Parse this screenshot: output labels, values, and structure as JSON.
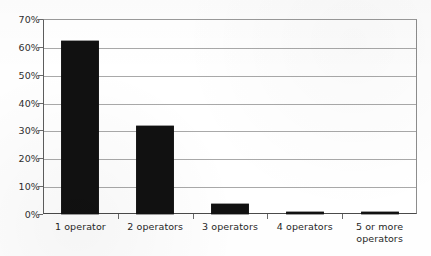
{
  "chart_data": {
    "type": "bar",
    "title": "",
    "subtitle": "",
    "xlabel": "",
    "ylabel": "",
    "categories": [
      "1 operator",
      "2 operators",
      "3 operators",
      "4 operators",
      "5 or more operators"
    ],
    "category_lines": [
      [
        "1 operator"
      ],
      [
        "2 operators"
      ],
      [
        "3 operators"
      ],
      [
        "4 operators"
      ],
      [
        "5 or more",
        "operators"
      ]
    ],
    "values": [
      62,
      31.7,
      3.5,
      0.8,
      0.3
    ],
    "value_labels": [
      "62%",
      "31.7%",
      "3.5%",
      "0.8%",
      "0.3%"
    ],
    "ylim": [
      0,
      70
    ],
    "ytick_values": [
      0,
      10,
      20,
      30,
      40,
      50,
      60,
      70
    ],
    "ytick_labels": [
      "0%",
      "10%",
      "20%",
      "30%",
      "40%",
      "50%",
      "60%",
      "70%"
    ],
    "grid": true,
    "legend": false,
    "legend_position": "none",
    "bar_color": "#111111",
    "gridline_color": "#a9a9a9",
    "axis_color": "#4a4a4a",
    "background_color": "#ffffff"
  }
}
